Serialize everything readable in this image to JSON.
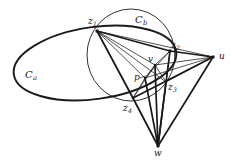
{
  "figure": {
    "type": "geometric-diagram",
    "background_color": "#ffffff",
    "stroke_color": "#1a1a1a",
    "labels": [
      {
        "id": "z1",
        "text": "z",
        "subscript": "1",
        "x": 88,
        "y": 17,
        "kind": "point"
      },
      {
        "id": "z2",
        "text": "z",
        "subscript": "2",
        "x": 171,
        "y": 41,
        "kind": "point"
      },
      {
        "id": "z3",
        "text": "z",
        "subscript": "3",
        "x": 168,
        "y": 83,
        "kind": "point"
      },
      {
        "id": "z4",
        "text": "z",
        "subscript": "4",
        "x": 123,
        "y": 104,
        "kind": "point"
      },
      {
        "id": "v",
        "text": "v",
        "subscript": "",
        "x": 148,
        "y": 55,
        "kind": "point"
      },
      {
        "id": "p",
        "text": "p",
        "subscript": "",
        "x": 134,
        "y": 73,
        "kind": "point"
      },
      {
        "id": "u",
        "text": "u",
        "subscript": "",
        "x": 219,
        "y": 52,
        "kind": "point"
      },
      {
        "id": "w",
        "text": "w",
        "subscript": "",
        "x": 154,
        "y": 149,
        "kind": "point"
      },
      {
        "id": "Ca",
        "text": "C",
        "subscript": "a",
        "x": 25,
        "y": 70,
        "kind": "curve"
      },
      {
        "id": "Cb",
        "text": "C",
        "subscript": "b",
        "x": 135,
        "y": 15,
        "kind": "curve"
      }
    ],
    "vertices": {
      "z1": {
        "x": 97,
        "y": 31
      },
      "z2": {
        "x": 170,
        "y": 51
      },
      "z3": {
        "x": 166,
        "y": 82
      },
      "z4": {
        "x": 133,
        "y": 98
      },
      "v": {
        "x": 155,
        "y": 65
      },
      "p": {
        "x": 145,
        "y": 78
      },
      "u": {
        "x": 213,
        "y": 57
      },
      "w": {
        "x": 158,
        "y": 146
      }
    },
    "curves": {
      "Ca": {
        "cx": 95,
        "cy": 63,
        "rx": 82,
        "ry": 36,
        "rotation": -8,
        "name": "ellipse-ca"
      },
      "Cb": {
        "cx": 131,
        "cy": 55,
        "rx": 44,
        "ry": 46,
        "rotation": 0,
        "name": "circle-cb"
      }
    },
    "segments": [
      [
        "z1",
        "z2"
      ],
      [
        "z1",
        "v"
      ],
      [
        "z1",
        "p"
      ],
      [
        "z1",
        "z3"
      ],
      [
        "z1",
        "z4"
      ],
      [
        "z1",
        "w"
      ],
      [
        "z1",
        "u"
      ],
      [
        "z2",
        "u"
      ],
      [
        "z2",
        "v"
      ],
      [
        "z2",
        "z3"
      ],
      [
        "z2",
        "w"
      ],
      [
        "z2",
        "p"
      ],
      [
        "z3",
        "u"
      ],
      [
        "z3",
        "w"
      ],
      [
        "z3",
        "v"
      ],
      [
        "z4",
        "u"
      ],
      [
        "z4",
        "w"
      ],
      [
        "z4",
        "p"
      ],
      [
        "z4",
        "v"
      ],
      [
        "v",
        "p"
      ],
      [
        "v",
        "u"
      ],
      [
        "v",
        "w"
      ],
      [
        "p",
        "u"
      ],
      [
        "p",
        "w"
      ],
      [
        "u",
        "w"
      ]
    ]
  }
}
